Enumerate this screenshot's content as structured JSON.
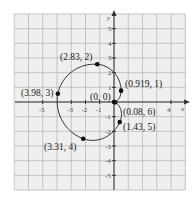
{
  "chart_data": {
    "type": "line",
    "subtype": "polar-curve",
    "title": "",
    "xlabel": "x",
    "ylabel": "y",
    "xlim": [
      -7,
      5
    ],
    "ylim": [
      -6,
      6
    ],
    "grid": true,
    "x_tick_labels": [
      "-5",
      "-3",
      "-2",
      "-1",
      "4"
    ],
    "x_tick_values": [
      -5,
      -3,
      -2,
      -1,
      4
    ],
    "y_tick_labels": [
      "5",
      "4",
      "3",
      "2",
      "1",
      "-1",
      "-2",
      "-3",
      "-4",
      "-5"
    ],
    "y_tick_values": [
      5,
      4,
      3,
      2,
      1,
      -1,
      -2,
      -3,
      -4,
      -5
    ],
    "points_polar": [
      {
        "label": "(0, 0)",
        "r": 0,
        "theta": 0
      },
      {
        "label": "(0.919, 1)",
        "r": 0.919,
        "theta": 1
      },
      {
        "label": "(2.83, 2)",
        "r": 2.83,
        "theta": 2
      },
      {
        "label": "(3.98, 3)",
        "r": 3.98,
        "theta": 3
      },
      {
        "label": "(3.31, 4)",
        "r": 3.31,
        "theta": 4
      },
      {
        "label": "(1.43, 5)",
        "r": 1.43,
        "theta": 5
      },
      {
        "label": "(0.08, 6)",
        "r": 0.08,
        "theta": 6
      }
    ]
  },
  "labels": {
    "p0": "(0, 0)",
    "p1": "(0.919, 1)",
    "p2": "(2.83, 2)",
    "p3": "(3.98, 3)",
    "p4": "(3.31, 4)",
    "p5": "(1.43, 5)",
    "p6": "(0.08, 6)",
    "x_axis": "x",
    "y_axis": "y"
  },
  "colors": {
    "grid": "#b8b8b8",
    "background": "#efefef",
    "axis": "#333333",
    "curve": "#333333",
    "point": "#111111"
  }
}
